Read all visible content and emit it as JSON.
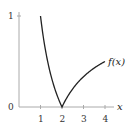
{
  "chart_data": {
    "type": "line",
    "title": "",
    "xlabel": "x",
    "ylabel": "",
    "function": "f(x) = |2/x - 1|",
    "series": [
      {
        "name": "f(x)",
        "x": [
          1,
          1.25,
          1.5,
          1.75,
          2,
          2.5,
          3,
          3.5,
          4
        ],
        "values": [
          1,
          0.6,
          0.333,
          0.143,
          0,
          0.2,
          0.333,
          0.429,
          0.5
        ]
      }
    ],
    "xticks": [
      "1",
      "2",
      "3",
      "4"
    ],
    "yticks": [
      "0",
      "1"
    ],
    "xlim": [
      0,
      4.3
    ],
    "ylim": [
      0,
      1.05
    ],
    "grid": false,
    "legend": "none",
    "annotations": [
      {
        "text": "f(x)",
        "x": 4,
        "y": 0.5
      }
    ]
  },
  "labels": {
    "curve": "f(x)",
    "x_axis": "x",
    "y_tick_0": "0",
    "y_tick_1": "1",
    "x_tick_1": "1",
    "x_tick_2": "2",
    "x_tick_3": "3",
    "x_tick_4": "4"
  }
}
